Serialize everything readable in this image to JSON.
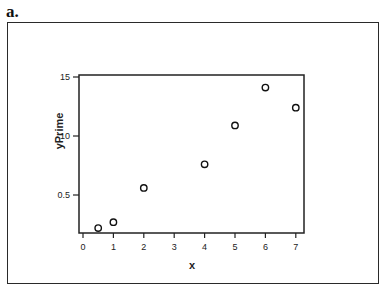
{
  "panel_label": "a.",
  "chart_data": {
    "type": "scatter",
    "title": "",
    "xlabel": "x",
    "ylabel": "yPrime",
    "x_ticks": [
      "0",
      "1",
      "2",
      "3",
      "4",
      "5",
      "6",
      "7"
    ],
    "x_tick_values": [
      0,
      1,
      2,
      3,
      4,
      5,
      6,
      7
    ],
    "y_ticks": [
      "0.5",
      "10",
      "15"
    ],
    "y_tick_values": [
      0.5,
      1.0,
      1.5
    ],
    "xlim": [
      -0.1,
      7.3
    ],
    "ylim": [
      0.17,
      1.5
    ],
    "grid": false,
    "legend": null,
    "marker": "open-circle",
    "series": [
      {
        "name": "yPrime",
        "x": [
          0.5,
          1,
          2,
          4,
          5,
          6,
          7
        ],
        "y": [
          0.22,
          0.27,
          0.56,
          0.76,
          1.09,
          1.41,
          1.24
        ]
      }
    ]
  }
}
